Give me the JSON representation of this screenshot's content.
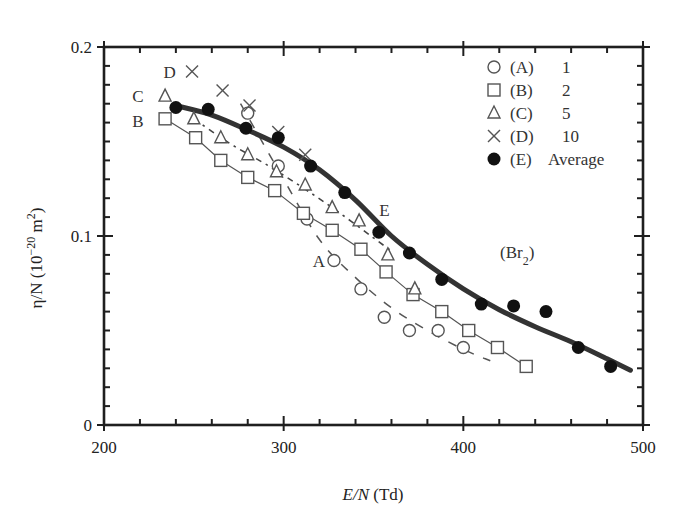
{
  "chart_data": {
    "type": "line",
    "title": "",
    "xlabel": "E/N (Td)",
    "xlabel_parts": {
      "italic": "E/N",
      "rest": " (Td)"
    },
    "ylabel": "η/N (10^-20 m^2)",
    "ylabel_parts": {
      "main": "η/N (10",
      "sup1": "−20",
      "mid": " m",
      "sup2": "2",
      "end": ")"
    },
    "xlim": [
      200,
      500
    ],
    "ylim": [
      0,
      0.2
    ],
    "xticks": [
      200,
      300,
      400,
      500
    ],
    "xtick_labels": [
      "200",
      "300",
      "400",
      "500"
    ],
    "yticks": [
      0,
      0.1,
      0.2
    ],
    "ytick_labels": [
      "0",
      "0.1",
      "0.2"
    ],
    "x_minor_step": 20,
    "y_minor_step": 0.01,
    "grid": false,
    "legend_position": "upper right",
    "annotation_gas": "(Br₂)",
    "series": [
      {
        "name": "(A) 1",
        "key": "A",
        "label": "(A)",
        "value_label": "1",
        "marker": "circle-open",
        "line": "dash-long",
        "x": [
          280,
          297,
          313,
          328,
          343,
          356,
          370,
          386,
          400
        ],
        "y": [
          0.165,
          0.137,
          0.109,
          0.087,
          0.072,
          0.057,
          0.05,
          0.05,
          0.041
        ],
        "curve_x": [
          276,
          300,
          320,
          340,
          360,
          380,
          400,
          415
        ],
        "curve_y": [
          0.17,
          0.13,
          0.098,
          0.078,
          0.062,
          0.05,
          0.04,
          0.034
        ]
      },
      {
        "name": "(B) 2",
        "key": "B",
        "label": "(B)",
        "value_label": "2",
        "marker": "square-open",
        "line": "solid-thin",
        "x": [
          234,
          251,
          265,
          280,
          295,
          311,
          327,
          343,
          357,
          372,
          388,
          403,
          419,
          435
        ],
        "y": [
          0.162,
          0.152,
          0.14,
          0.131,
          0.124,
          0.112,
          0.103,
          0.093,
          0.081,
          0.069,
          0.06,
          0.05,
          0.041,
          0.031
        ]
      },
      {
        "name": "(C) 5",
        "key": "C",
        "label": "(C)",
        "value_label": "5",
        "marker": "triangle-open",
        "line": "dash-dot",
        "x": [
          234,
          250,
          265,
          280,
          296,
          312,
          327,
          342,
          358,
          373
        ],
        "y": [
          0.174,
          0.162,
          0.152,
          0.143,
          0.134,
          0.127,
          0.115,
          0.108,
          0.09,
          0.072
        ],
        "curve_x": [
          250,
          270,
          290,
          310,
          330,
          350,
          360
        ],
        "curve_y": [
          0.162,
          0.149,
          0.138,
          0.126,
          0.113,
          0.099,
          0.092
        ]
      },
      {
        "name": "(D) 10",
        "key": "D",
        "label": "(D)",
        "value_label": "10",
        "marker": "x",
        "line": "none",
        "x": [
          249,
          266,
          281,
          297,
          312
        ],
        "y": [
          0.187,
          0.177,
          0.169,
          0.155,
          0.143
        ]
      },
      {
        "name": "(E) Average",
        "key": "E",
        "label": "(E)",
        "value_label": "Average",
        "marker": "circle-filled",
        "line": "solid-thick",
        "x": [
          240,
          258,
          279,
          297,
          315,
          334,
          353,
          370,
          388,
          410,
          428,
          446,
          464,
          482
        ],
        "y": [
          0.168,
          0.167,
          0.157,
          0.152,
          0.137,
          0.123,
          0.102,
          0.091,
          0.077,
          0.064,
          0.063,
          0.06,
          0.041,
          0.031
        ],
        "curve_x": [
          240,
          260,
          280,
          300,
          320,
          340,
          360,
          380,
          400,
          420,
          440,
          460,
          480,
          493
        ],
        "curve_y": [
          0.169,
          0.164,
          0.156,
          0.147,
          0.135,
          0.119,
          0.1,
          0.085,
          0.072,
          0.061,
          0.052,
          0.044,
          0.035,
          0.029
        ]
      }
    ],
    "curve_labels": [
      {
        "text": "A",
        "x": 323,
        "y": 0.087
      },
      {
        "text": "B",
        "x": 222,
        "y": 0.161
      },
      {
        "text": "C",
        "x": 222,
        "y": 0.174
      },
      {
        "text": "D",
        "x": 240,
        "y": 0.187
      },
      {
        "text": "E",
        "x": 359,
        "y": 0.114
      }
    ]
  },
  "colors": {
    "ink": "#1f1f1f",
    "thick_line": "#333333",
    "marker_stroke": "#555555"
  }
}
